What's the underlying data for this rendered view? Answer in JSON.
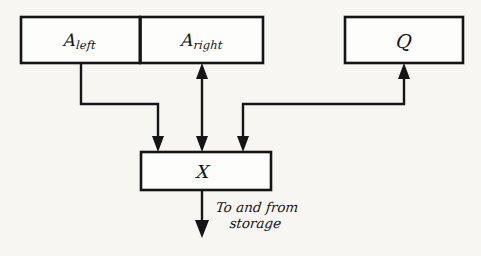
{
  "diagram": {
    "background_color": "#f7f6f3",
    "ink_color": "#151515",
    "boxes": [
      {
        "id": "a-left",
        "label_main": "A",
        "label_sub": "left",
        "x": 21,
        "y": 17,
        "w": 119,
        "h": 46
      },
      {
        "id": "a-right",
        "label_main": "A",
        "label_sub": "right",
        "x": 140,
        "y": 17,
        "w": 123,
        "h": 46
      },
      {
        "id": "q",
        "label_main": "Q",
        "label_sub": "",
        "x": 345,
        "y": 17,
        "w": 118,
        "h": 46
      },
      {
        "id": "x",
        "label_main": "X",
        "label_sub": "",
        "x": 141,
        "y": 152,
        "w": 130,
        "h": 38
      }
    ],
    "caption": {
      "line1": "To and from",
      "line2": "storage"
    }
  }
}
